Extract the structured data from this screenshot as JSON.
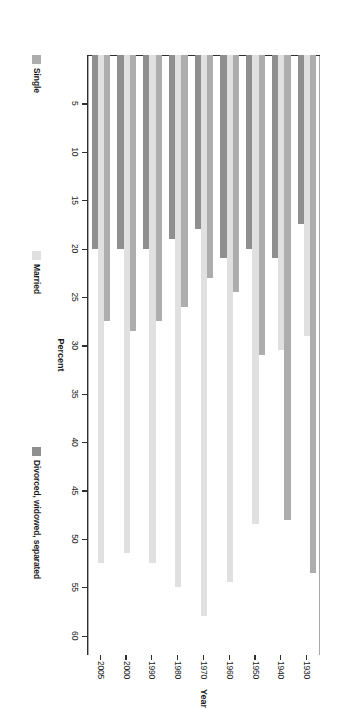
{
  "chart_data": {
    "type": "bar",
    "orientation": "horizontal",
    "title": "",
    "xlabel": "Percent",
    "ylabel": "Year",
    "categories": [
      "1930",
      "1940",
      "1950",
      "1960",
      "1970",
      "1980",
      "1990",
      "2000",
      "2005"
    ],
    "series": [
      {
        "name": "Single",
        "color": "#adadad",
        "values": [
          53.5,
          48.0,
          31.0,
          24.5,
          23.0,
          26.0,
          27.5,
          28.5,
          27.5
        ]
      },
      {
        "name": "Married",
        "color": "#e0e0e0",
        "values": [
          29.0,
          30.5,
          48.5,
          54.5,
          58.0,
          55.0,
          52.5,
          51.5,
          52.5
        ]
      },
      {
        "name": "Divorced, widowed, separated",
        "color": "#8f8f8f",
        "values": [
          17.5,
          21.0,
          20.0,
          21.0,
          18.0,
          19.0,
          20.0,
          20.0,
          20.0
        ]
      }
    ],
    "xlim": [
      0,
      62
    ],
    "x_ticks": [
      60,
      55,
      50,
      45,
      40,
      35,
      30,
      25,
      20,
      15,
      10,
      5
    ],
    "x_tick_labels": [
      "60",
      "55",
      "50",
      "45",
      "40",
      "35",
      "30",
      "25",
      "20",
      "15",
      "10",
      "5"
    ],
    "grid": false,
    "legend_position": "bottom",
    "legend": [
      "Single",
      "Married",
      "Divorced, widowed, separated"
    ]
  },
  "axes": {
    "value_axis_title": "Percent",
    "category_axis_title": "Year"
  },
  "colors": {
    "single": "#adadad",
    "married": "#e0e0e0",
    "divorced": "#8f8f8f",
    "axis": "#2f2f2f",
    "frame": "#a8a8a8",
    "background": "#ffffff"
  }
}
